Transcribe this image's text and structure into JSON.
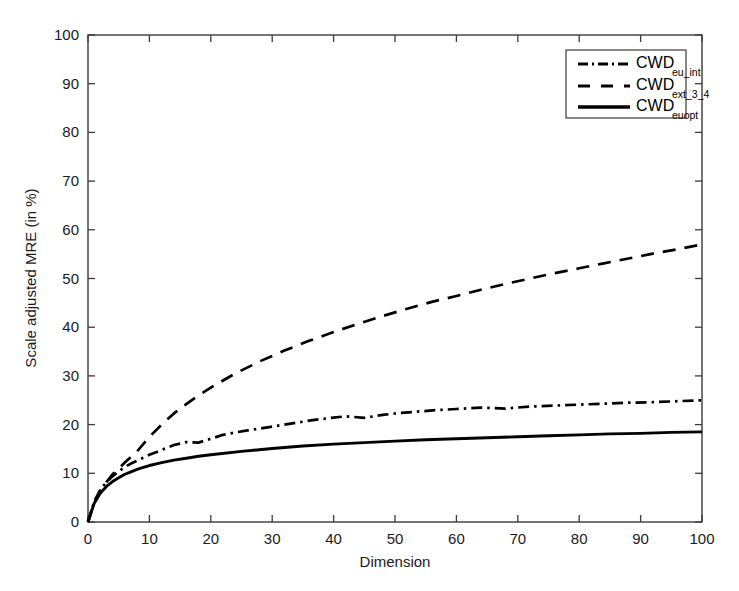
{
  "chart_data": {
    "type": "line",
    "title": "",
    "xlabel": "Dimension",
    "ylabel": "Scale adjusted MRE (in %)",
    "xlim": [
      0,
      100
    ],
    "ylim": [
      0,
      100
    ],
    "xticks": [
      0,
      10,
      20,
      30,
      40,
      50,
      60,
      70,
      80,
      90,
      100
    ],
    "yticks": [
      0,
      10,
      20,
      30,
      40,
      50,
      60,
      70,
      80,
      90,
      100
    ],
    "grid": false,
    "legend_position": "top-right",
    "line_color": "#000000",
    "series": [
      {
        "name": "CWD_eu_int",
        "label_main": "CWD",
        "label_sub": "eu_int",
        "style": "dash-dot",
        "x": [
          0,
          1,
          2,
          3,
          4,
          5,
          6,
          7,
          8,
          9,
          10,
          12,
          14,
          16,
          18,
          20,
          22,
          24,
          26,
          28,
          30,
          33,
          36,
          39,
          42,
          45,
          48,
          51,
          54,
          57,
          60,
          64,
          68,
          72,
          76,
          80,
          84,
          88,
          92,
          96,
          100
        ],
        "y": [
          0,
          4.2,
          6.6,
          8.2,
          9.4,
          10.4,
          11.3,
          12.0,
          12.6,
          13.2,
          13.8,
          14.8,
          15.8,
          16.4,
          16.3,
          17.1,
          17.9,
          18.4,
          18.8,
          19.2,
          19.6,
          20.2,
          20.8,
          21.3,
          21.7,
          21.4,
          22.0,
          22.4,
          22.7,
          23.0,
          23.2,
          23.5,
          23.3,
          23.7,
          23.9,
          24.1,
          24.3,
          24.5,
          24.6,
          24.8,
          25.0
        ]
      },
      {
        "name": "CWD_ext_3_4",
        "label_main": "CWD",
        "label_sub": "ext_3_4",
        "style": "dashed",
        "x": [
          0,
          1,
          2,
          3,
          4,
          5,
          6,
          8,
          10,
          12,
          14,
          16,
          18,
          20,
          24,
          28,
          32,
          36,
          40,
          44,
          48,
          52,
          56,
          60,
          64,
          68,
          72,
          76,
          80,
          84,
          88,
          92,
          96,
          100
        ],
        "y": [
          0,
          4.0,
          6.4,
          8.2,
          9.8,
          11.0,
          12.2,
          14.5,
          17.5,
          20.0,
          22.3,
          24.2,
          26.0,
          27.6,
          30.5,
          33.0,
          35.2,
          37.2,
          39.0,
          40.7,
          42.3,
          43.8,
          45.2,
          46.4,
          47.7,
          48.9,
          50.0,
          51.1,
          52.1,
          53.1,
          54.1,
          55.1,
          56.0,
          57.0
        ]
      },
      {
        "name": "CWD_euopt",
        "label_main": "CWD",
        "label_sub": "euopt",
        "style": "solid",
        "x": [
          0,
          1,
          2,
          3,
          4,
          5,
          6,
          7,
          8,
          9,
          10,
          12,
          14,
          16,
          18,
          20,
          25,
          30,
          35,
          40,
          45,
          50,
          55,
          60,
          65,
          70,
          75,
          80,
          85,
          90,
          95,
          100
        ],
        "y": [
          0,
          3.8,
          5.9,
          7.3,
          8.3,
          9.1,
          9.8,
          10.3,
          10.8,
          11.2,
          11.6,
          12.2,
          12.7,
          13.1,
          13.5,
          13.8,
          14.5,
          15.1,
          15.6,
          16.0,
          16.3,
          16.6,
          16.9,
          17.1,
          17.3,
          17.5,
          17.7,
          17.9,
          18.1,
          18.2,
          18.4,
          18.5
        ]
      }
    ]
  },
  "axes": {
    "x_tick_labels": [
      "0",
      "10",
      "20",
      "30",
      "40",
      "50",
      "60",
      "70",
      "80",
      "90",
      "100"
    ],
    "y_tick_labels": [
      "0",
      "10",
      "20",
      "30",
      "40",
      "50",
      "60",
      "70",
      "80",
      "90",
      "100"
    ],
    "x_axis_title": "Dimension",
    "y_axis_title": "Scale adjusted MRE (in %)"
  },
  "legend": {
    "entries": [
      {
        "main": "CWD",
        "sub": "eu_int",
        "style": "dash-dot"
      },
      {
        "main": "CWD",
        "sub": "ext_3_4",
        "style": "dashed"
      },
      {
        "main": "CWD",
        "sub": "euopt",
        "style": "solid"
      }
    ]
  }
}
